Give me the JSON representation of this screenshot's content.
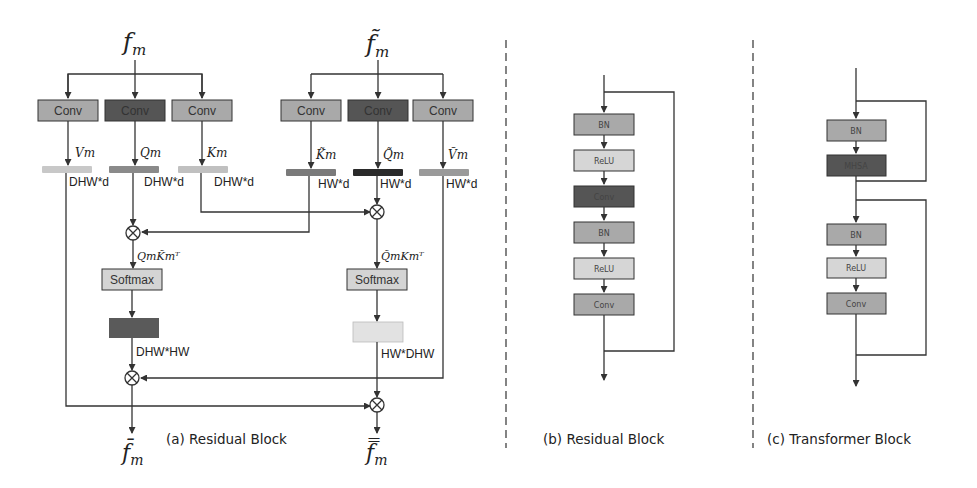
{
  "figure": {
    "panel_a": {
      "caption": "(a) Residual Block",
      "input_left": "f",
      "input_left_sub": "m",
      "input_right": "f̃",
      "input_right_sub": "m",
      "output_left": "f̄",
      "output_left_sub": "m",
      "output_right": "f̿",
      "output_right_sub": "m",
      "left_convs": [
        {
          "label": "Conv",
          "color": "#a9a9a9"
        },
        {
          "label": "Conv",
          "color": "#555555"
        },
        {
          "label": "Conv",
          "color": "#a9a9a9"
        }
      ],
      "right_convs": [
        {
          "label": "Conv",
          "color": "#a9a9a9"
        },
        {
          "label": "Conv",
          "color": "#555555"
        },
        {
          "label": "Conv",
          "color": "#a9a9a9"
        }
      ],
      "left_vars": [
        "Vm",
        "Qm",
        "Km"
      ],
      "right_vars": [
        "K̃m",
        "Q̃m",
        "Ṽm"
      ],
      "left_dims": [
        "DHW*d",
        "DHW*d",
        "DHW*d"
      ],
      "right_dims": [
        "HW*d",
        "HW*d",
        "HW*d"
      ],
      "left_product": "QmK̃mᵀ",
      "right_product": "Q̃mKmᵀ",
      "softmax_label": "Softmax",
      "left_attn_dim": "DHW*HW",
      "right_attn_dim": "HW*DHW",
      "colors": {
        "left_tensor_v": "#c8c8c8",
        "left_tensor_q": "#8a8a8a",
        "left_tensor_k": "#c0c0c0",
        "right_tensor_k": "#7a7a7a",
        "right_tensor_q": "#2a2a2a",
        "right_tensor_v": "#9a9a9a",
        "left_attn": "#5a5a5a",
        "right_attn": "#e2e2e2",
        "softmax": "#d4d4d4"
      }
    },
    "panel_b": {
      "caption": "(b) Residual Block",
      "blocks": [
        {
          "label": "BN",
          "color": "#a9a9a9"
        },
        {
          "label": "ReLU",
          "color": "#d6d6d6"
        },
        {
          "label": "Conv",
          "color": "#555555"
        },
        {
          "label": "BN",
          "color": "#a9a9a9"
        },
        {
          "label": "ReLU",
          "color": "#d6d6d6"
        },
        {
          "label": "Conv",
          "color": "#a9a9a9"
        }
      ]
    },
    "panel_c": {
      "caption": "(c) Transformer Block",
      "blocks": [
        {
          "label": "BN",
          "color": "#a9a9a9"
        },
        {
          "label": "MHSA",
          "color": "#555555"
        },
        {
          "label": "BN",
          "color": "#a9a9a9"
        },
        {
          "label": "ReLU",
          "color": "#d6d6d6"
        },
        {
          "label": "Conv",
          "color": "#a9a9a9"
        }
      ]
    }
  }
}
